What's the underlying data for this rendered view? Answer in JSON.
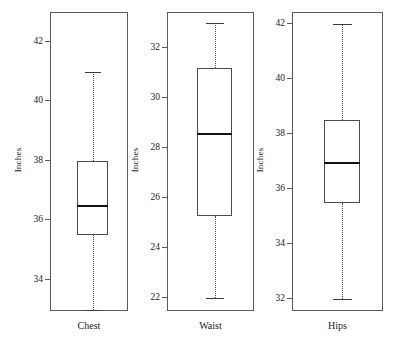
{
  "chart_data": {
    "type": "box",
    "title": "",
    "xlabel": "",
    "ylabel": "Inches",
    "grid": false,
    "legend": null,
    "layout": "three side-by-side panels, each with its own y-axis",
    "categories": [
      "Chest",
      "Waist",
      "Hips"
    ],
    "panels": [
      {
        "category": "Chest",
        "ylabel": "Inches",
        "ylim": [
          32.95,
          43.0
        ],
        "ticks": [
          34,
          36,
          38,
          40,
          42
        ],
        "tick_labels": [
          "34",
          "36",
          "38",
          "40",
          "42"
        ],
        "stats": {
          "whisker_low": 33.0,
          "q1": 35.5,
          "median": 36.5,
          "q3": 38.0,
          "whisker_high": 41.0
        }
      },
      {
        "category": "Waist",
        "ylabel": "Inches",
        "ylim": [
          21.5,
          33.45
        ],
        "ticks": [
          22,
          24,
          26,
          28,
          30,
          32
        ],
        "tick_labels": [
          "22",
          "24",
          "26",
          "28",
          "30",
          "32"
        ],
        "stats": {
          "whisker_low": 22.0,
          "q1": 25.3,
          "median": 28.6,
          "q3": 31.2,
          "whisker_high": 33.0
        }
      },
      {
        "category": "Hips",
        "ylabel": "Inches",
        "ylim": [
          31.55,
          42.45
        ],
        "ticks": [
          32,
          34,
          36,
          38,
          40,
          42
        ],
        "tick_labels": [
          "32",
          "34",
          "36",
          "38",
          "40",
          "42"
        ],
        "stats": {
          "whisker_low": 32.0,
          "q1": 35.5,
          "median": 37.0,
          "q3": 38.5,
          "whisker_high": 42.0
        }
      }
    ]
  },
  "figure": {
    "panels": [
      {
        "label": "Chest",
        "axis_title": "Inches",
        "frame": {
          "left": 50,
          "top": 12,
          "width": 78,
          "height": 299
        }
      },
      {
        "label": "Waist",
        "axis_title": "Inches",
        "frame": {
          "left": 167,
          "top": 12,
          "width": 87,
          "height": 299
        }
      },
      {
        "label": "Hips",
        "axis_title": "Inches",
        "frame": {
          "left": 292,
          "top": 12,
          "width": 91,
          "height": 299
        }
      }
    ]
  }
}
